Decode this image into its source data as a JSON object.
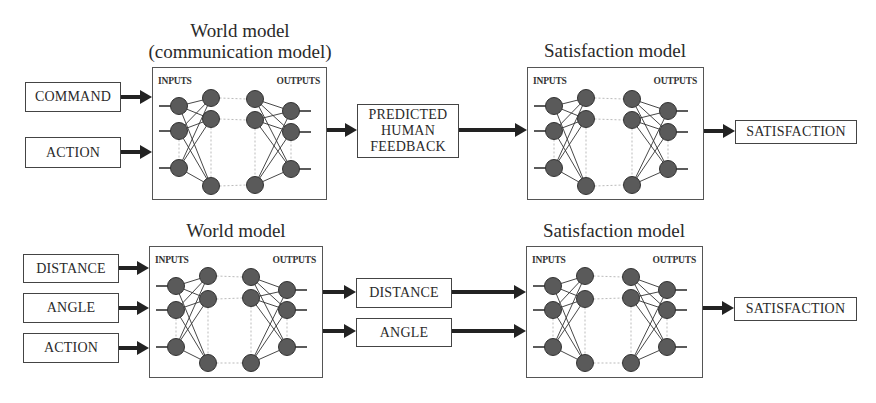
{
  "colors": {
    "line": "#333333",
    "arrow": "#222222",
    "node_fill": "#5a5a5a",
    "node_stroke": "#333333",
    "dotted": "#bbbbbb",
    "border": "#444444"
  },
  "rows": [
    {
      "id": "top",
      "world_model": {
        "title": "World model\n(communication model)",
        "title_box": {
          "x": 140,
          "y": 20,
          "w": 200
        },
        "box": {
          "x": 152,
          "y": 67,
          "w": 175,
          "h": 133
        },
        "inputs_label": "INPUTS",
        "outputs_label": "OUTPUTS",
        "input_nodes_y": [
          38,
          63,
          100
        ],
        "hidden1_y": [
          30,
          51,
          118
        ],
        "hidden2_y": [
          31,
          52,
          117
        ],
        "output_nodes_y": [
          43,
          64,
          101
        ]
      },
      "inputs": [
        {
          "label": "COMMAND",
          "box": {
            "x": 25,
            "y": 82,
            "w": 96,
            "h": 30
          },
          "arrow_y": 97,
          "arrow_to": 152
        },
        {
          "label": "ACTION",
          "box": {
            "x": 25,
            "y": 137,
            "w": 96,
            "h": 31
          },
          "arrow_y": 152,
          "arrow_to": 152
        }
      ],
      "middle": [
        {
          "label": "PREDICTED\nHUMAN\nFEEDBACK",
          "box": {
            "x": 357,
            "y": 104,
            "w": 102,
            "h": 54
          },
          "arrow_y": 130
        }
      ],
      "satisfaction_model": {
        "title": "Satisfaction model",
        "title_box": {
          "x": 515,
          "y": 40,
          "w": 200
        },
        "box": {
          "x": 527,
          "y": 67,
          "w": 177,
          "h": 133
        },
        "inputs_label": "INPUTS",
        "outputs_label": "OUTPUTS",
        "input_nodes_y": [
          38,
          63,
          100
        ],
        "hidden1_y": [
          30,
          51,
          118
        ],
        "hidden2_y": [
          31,
          52,
          117
        ],
        "output_nodes_y": [
          43,
          64,
          101
        ]
      },
      "output": {
        "label": "SATISFACTION",
        "box": {
          "x": 735,
          "y": 120,
          "w": 122,
          "h": 24
        },
        "arrow_y": 131
      }
    },
    {
      "id": "bottom",
      "world_model": {
        "title": "World model",
        "title_box": {
          "x": 136,
          "y": 220,
          "w": 200
        },
        "box": {
          "x": 149,
          "y": 246,
          "w": 174,
          "h": 132
        },
        "inputs_label": "INPUTS",
        "outputs_label": "OUTPUTS",
        "input_nodes_y": [
          39,
          63,
          100
        ],
        "hidden1_y": [
          29,
          52,
          116
        ],
        "hidden2_y": [
          30,
          51,
          116
        ],
        "output_nodes_y": [
          43,
          63,
          100
        ]
      },
      "inputs": [
        {
          "label": "DISTANCE",
          "box": {
            "x": 23,
            "y": 254,
            "w": 96,
            "h": 29
          },
          "arrow_y": 268,
          "arrow_to": 149
        },
        {
          "label": "ANGLE",
          "box": {
            "x": 23,
            "y": 293,
            "w": 96,
            "h": 30
          },
          "arrow_y": 308,
          "arrow_to": 149
        },
        {
          "label": "ACTION",
          "box": {
            "x": 23,
            "y": 333,
            "w": 96,
            "h": 30
          },
          "arrow_y": 348,
          "arrow_to": 149
        }
      ],
      "middle": [
        {
          "label": "DISTANCE",
          "box": {
            "x": 356,
            "y": 278,
            "w": 96,
            "h": 30
          },
          "arrow_y": 292
        },
        {
          "label": "ANGLE",
          "box": {
            "x": 356,
            "y": 318,
            "w": 96,
            "h": 29
          },
          "arrow_y": 331
        }
      ],
      "satisfaction_model": {
        "title": "Satisfaction model",
        "title_box": {
          "x": 514,
          "y": 220,
          "w": 200
        },
        "box": {
          "x": 526,
          "y": 246,
          "w": 177,
          "h": 132
        },
        "inputs_label": "INPUTS",
        "outputs_label": "OUTPUTS",
        "input_nodes_y": [
          39,
          63,
          100
        ],
        "hidden1_y": [
          29,
          52,
          116
        ],
        "hidden2_y": [
          30,
          51,
          116
        ],
        "output_nodes_y": [
          43,
          63,
          100
        ]
      },
      "output": {
        "label": "SATISFACTION",
        "box": {
          "x": 734,
          "y": 297,
          "w": 123,
          "h": 24
        },
        "arrow_y": 308
      }
    }
  ]
}
